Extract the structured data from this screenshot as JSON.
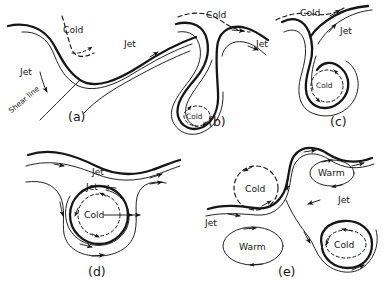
{
  "figure": {
    "type": "schematic-diagram",
    "style": "hand-drawn black-and-white line drawing",
    "background_color": "#ffffff",
    "ink_color": "#161616"
  },
  "panels": [
    {
      "id": "a",
      "caption": "(a)",
      "labels": [
        {
          "key": "cold",
          "text": "Cold"
        },
        {
          "key": "jet_right",
          "text": "Jet"
        },
        {
          "key": "jet_left",
          "text": "Jet"
        },
        {
          "key": "shear_line",
          "text": "Shear line"
        }
      ]
    },
    {
      "id": "b",
      "caption": "(b)",
      "labels": [
        {
          "key": "cold",
          "text": "Cold"
        },
        {
          "key": "jet",
          "text": "Jet"
        },
        {
          "key": "cold_inner",
          "text": "Cold"
        }
      ]
    },
    {
      "id": "c",
      "caption": "(c)",
      "labels": [
        {
          "key": "cold",
          "text": "Cold"
        },
        {
          "key": "jet",
          "text": "Jet"
        },
        {
          "key": "cold_inner",
          "text": "Cold"
        }
      ]
    },
    {
      "id": "d",
      "caption": "(d)",
      "labels": [
        {
          "key": "jet_upper",
          "text": "Jet"
        },
        {
          "key": "jet_lower",
          "text": "Jet"
        },
        {
          "key": "cold",
          "text": "Cold"
        }
      ]
    },
    {
      "id": "e",
      "caption": "(e)",
      "labels": [
        {
          "key": "cold_upper_left",
          "text": "Cold"
        },
        {
          "key": "warm_upper_right",
          "text": "Warm"
        },
        {
          "key": "warm_lower_left",
          "text": "Warm"
        },
        {
          "key": "cold_lower_right",
          "text": "Cold"
        },
        {
          "key": "jet_left",
          "text": "Jet"
        },
        {
          "key": "jet_right",
          "text": "Jet"
        }
      ]
    }
  ]
}
